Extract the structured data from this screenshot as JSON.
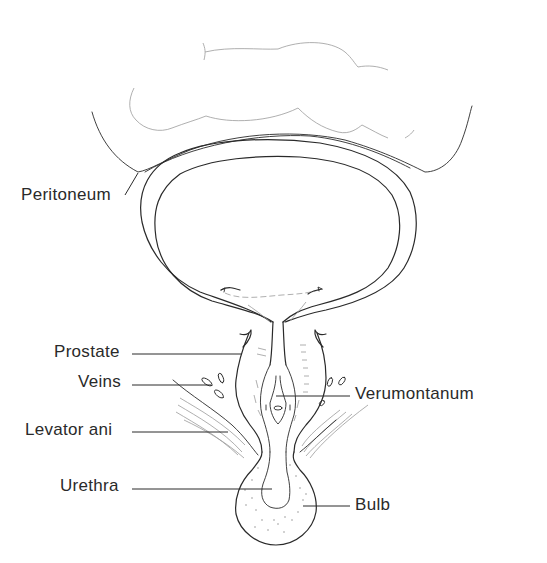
{
  "figure": {
    "labels": {
      "peritoneum": "Peritoneum",
      "prostate": "Prostate",
      "veins": "Veins",
      "levator_ani": "Levator ani",
      "urethra": "Urethra",
      "verumontanum": "Verumontanum",
      "bulb": "Bulb"
    }
  },
  "colors": {
    "ink": "#2a2a2a",
    "faint_ink": "#9a9a9a",
    "background": "#ffffff"
  }
}
